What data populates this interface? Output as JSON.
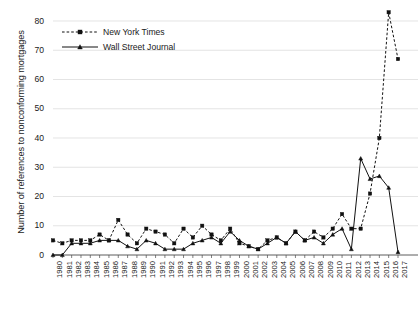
{
  "chart_data": {
    "type": "line",
    "title": "",
    "xlabel": "",
    "ylabel": "Number of references to nonconforming mortgages",
    "ylim": [
      0,
      85
    ],
    "yticks": [
      0,
      10,
      20,
      30,
      40,
      50,
      60,
      70,
      80
    ],
    "grid": true,
    "legend_position": "top-left",
    "categories": [
      "1980",
      "1981",
      "1982",
      "1983",
      "1984",
      "1985",
      "1986",
      "1987",
      "1988",
      "1989",
      "1990",
      "1991",
      "1992",
      "1993",
      "1994",
      "1995",
      "1996",
      "1997",
      "1998",
      "1999",
      "2000",
      "2001",
      "2002",
      "2003",
      "2004",
      "2005",
      "2006",
      "2007",
      "2008",
      "2009",
      "2010",
      "2011",
      "2012",
      "2013",
      "2014",
      "2015",
      "2016",
      "2017"
    ],
    "series": [
      {
        "name": "New York Times",
        "marker": "square",
        "line_style": "dashed",
        "color": "#111111",
        "values": [
          5,
          4,
          5,
          5,
          5,
          7,
          5,
          12,
          7,
          4,
          9,
          8,
          7,
          4,
          9,
          6,
          10,
          7,
          5,
          9,
          4,
          3,
          2,
          5,
          6,
          4,
          8,
          5,
          8,
          6,
          9,
          14,
          9,
          9,
          21,
          40,
          83,
          67
        ]
      },
      {
        "name": "Wall Street Journal",
        "marker": "triangle",
        "line_style": "solid",
        "color": "#111111",
        "values": [
          0,
          0,
          4,
          4,
          4,
          5,
          5,
          5,
          3,
          2,
          5,
          4,
          2,
          2,
          2,
          4,
          5,
          6,
          4,
          8,
          5,
          3,
          2,
          4,
          6,
          4,
          8,
          5,
          6,
          4,
          7,
          9,
          2,
          33,
          26,
          27,
          23,
          1
        ]
      }
    ]
  },
  "legend": {
    "items": [
      {
        "label": "New York Times"
      },
      {
        "label": "Wall Street Journal"
      }
    ]
  }
}
